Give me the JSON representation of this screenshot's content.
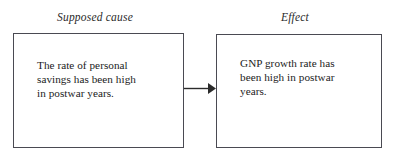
{
  "diagram": {
    "type": "cause-effect-flow",
    "background_color": "#ffffff",
    "border_color": "#4a4a52",
    "text_color": "#1b1b1b",
    "labels": {
      "cause": "Supposed cause",
      "effect": "Effect"
    },
    "nodes": [
      {
        "id": "cause",
        "role": "supposed-cause",
        "text": "The rate of personal\nsavings has been high\nin postwar years.",
        "lines": [
          "The rate of personal",
          "savings has been high",
          "in postwar years."
        ]
      },
      {
        "id": "effect",
        "role": "effect",
        "text": "GNP growth rate has\nbeen high in postwar\nyears.",
        "lines": [
          "GNP growth rate has",
          "been high in postwar",
          "years."
        ]
      }
    ],
    "connector": {
      "from": "cause",
      "to": "effect",
      "style": "solid-line-filled-arrowhead",
      "direction": "right",
      "color": "#2b2b2b"
    }
  }
}
